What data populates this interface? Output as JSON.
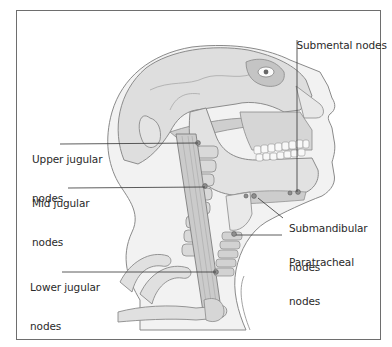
{
  "figure": {
    "labels": [
      {
        "id": "submental",
        "line1": "Submental nodes",
        "line2": ""
      },
      {
        "id": "upper-jugular",
        "line1": "Upper jugular",
        "line2": "nodes"
      },
      {
        "id": "mid-jugular",
        "line1": "Mid jugular",
        "line2": "nodes"
      },
      {
        "id": "submandibular",
        "line1": "Submandibular",
        "line2": "nodes"
      },
      {
        "id": "paratracheal",
        "line1": "Paratracheal",
        "line2": "nodes"
      },
      {
        "id": "lower-jugular",
        "line1": "Lower jugular",
        "line2": "nodes"
      }
    ]
  },
  "colors": {
    "border": "#6e6e6e",
    "text": "#2a2a2a",
    "skin": "#f1f1f1",
    "bone": "#dcdcdc",
    "bone_dark": "#b9b9b9",
    "outline": "#7a7a7a",
    "leader": "#333333"
  }
}
